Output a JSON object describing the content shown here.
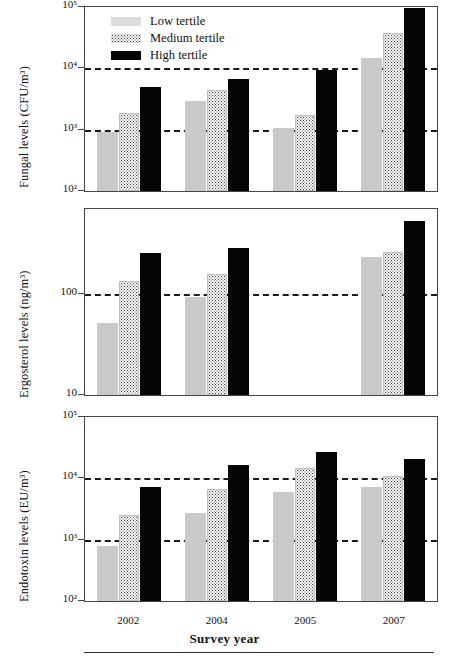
{
  "axis": {
    "x_title": "Survey year",
    "categories": [
      "2002",
      "2004",
      "2005",
      "2007"
    ]
  },
  "legend": {
    "items": [
      {
        "key": "low",
        "label": "Low tertile",
        "color": "#dcdcdc"
      },
      {
        "key": "medium",
        "label": "Medium tertile",
        "color": "#ffffff"
      },
      {
        "key": "high",
        "label": "High tertile",
        "color": "#050505"
      }
    ]
  },
  "panels": [
    {
      "id": "fungal",
      "y_title": "Fungal levels (CFU/m³)",
      "y_ticks": [
        "10²",
        "10³",
        "10⁴",
        "10⁵"
      ]
    },
    {
      "id": "ergosterol",
      "y_title": "Ergosterol levels (ng/m³)",
      "y_ticks": [
        "10",
        "100"
      ]
    },
    {
      "id": "endotoxin",
      "y_title": "Endotoxin levels (EU/m³)",
      "y_ticks": [
        "10²",
        "10³",
        "10⁴",
        "10⁵"
      ]
    }
  ],
  "chart_data": [
    {
      "type": "bar",
      "title": "",
      "panel": "fungal",
      "xlabel": "Survey year",
      "ylabel": "Fungal levels (CFU/m³)",
      "yscale": "log",
      "ylim": [
        100,
        100000
      ],
      "ytick_values": [
        100,
        1000,
        10000,
        100000
      ],
      "ytick_labels": [
        "10²",
        "10³",
        "10⁴",
        "10⁵"
      ],
      "gridlines": [
        1000,
        10000
      ],
      "grid": "horizontal-dashed",
      "legend_position": "upper-left-inside",
      "categories": [
        "2002",
        "2004",
        "2005",
        "2007"
      ],
      "series": [
        {
          "name": "Low tertile",
          "values": [
            900,
            2900,
            1050,
            15000
          ]
        },
        {
          "name": "Medium tertile",
          "values": [
            1900,
            4500,
            1750,
            38000
          ]
        },
        {
          "name": "High tertile",
          "values": [
            4900,
            6700,
            9300,
            98000
          ]
        }
      ]
    },
    {
      "type": "bar",
      "title": "",
      "panel": "ergosterol",
      "xlabel": "Survey year",
      "ylabel": "Ergosterol levels (ng/m³)",
      "yscale": "log",
      "ylim": [
        10,
        700
      ],
      "ytick_values": [
        10,
        100
      ],
      "ytick_labels": [
        "10",
        "100"
      ],
      "gridlines": [
        100
      ],
      "grid": "horizontal-dashed",
      "legend_position": "none",
      "categories": [
        "2002",
        "2004",
        "2005",
        "2007"
      ],
      "series": [
        {
          "name": "Low tertile",
          "values": [
            52,
            93,
            null,
            235
          ]
        },
        {
          "name": "Medium tertile",
          "values": [
            135,
            160,
            null,
            265
          ]
        },
        {
          "name": "High tertile",
          "values": [
            255,
            290,
            null,
            530
          ]
        }
      ]
    },
    {
      "type": "bar",
      "title": "",
      "panel": "endotoxin",
      "xlabel": "Survey year",
      "ylabel": "Endotoxin levels (EU/m³)",
      "yscale": "log",
      "ylim": [
        100,
        100000
      ],
      "ytick_values": [
        100,
        1000,
        10000,
        100000
      ],
      "ytick_labels": [
        "10²",
        "10³",
        "10⁴",
        "10⁵"
      ],
      "gridlines": [
        1000,
        10000
      ],
      "grid": "horizontal-dashed",
      "legend_position": "none",
      "categories": [
        "2002",
        "2004",
        "2005",
        "2007"
      ],
      "series": [
        {
          "name": "Low tertile",
          "values": [
            780,
            2700,
            6000,
            7300
          ]
        },
        {
          "name": "Medium tertile",
          "values": [
            2500,
            6600,
            14500,
            11000
          ]
        },
        {
          "name": "High tertile",
          "values": [
            7300,
            16500,
            27000,
            21000
          ]
        }
      ]
    }
  ]
}
